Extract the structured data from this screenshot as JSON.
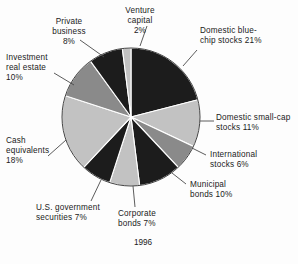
{
  "figure": {
    "year_caption": "1996",
    "background_color": "#fdfdfd",
    "text_color": "#1b1b1b",
    "leader_line_color": "#4a4a4a"
  },
  "chart_data": {
    "type": "pie",
    "title": "",
    "subtitle": "",
    "xlabel": "",
    "ylabel": "",
    "caption": "1996",
    "legend_position": "none",
    "labels_position": "outside-with-leader-lines",
    "grid": false,
    "start_angle_deg": 0,
    "direction": "clockwise",
    "total_percent": 100,
    "categories": [
      "Domestic blue-chip stocks",
      "Domestic small-cap stocks",
      "International stocks",
      "Municipal bonds",
      "Corporate bonds",
      "U.S. government securities",
      "Cash equivalents",
      "Investment real estate",
      "Private business",
      "Venture capital"
    ],
    "values": [
      21,
      11,
      6,
      10,
      7,
      7,
      18,
      10,
      8,
      2
    ],
    "value_unit": "%",
    "colors": [
      "#1c1c1c",
      "#c2c2c2",
      "#8a8a8a",
      "#1c1c1c",
      "#c2c2c2",
      "#1c1c1c",
      "#c2c2c2",
      "#8a8a8a",
      "#1c1c1c",
      "#c2c2c2"
    ],
    "slices": [
      {
        "label": "Domestic blue-chip stocks",
        "value": 21,
        "display": "Domestic blue-\nchip stocks  21%",
        "color": "#1c1c1c"
      },
      {
        "label": "Domestic small-cap stocks",
        "value": 11,
        "display": "Domestic small-cap\nstocks 11%",
        "color": "#c2c2c2"
      },
      {
        "label": "International stocks",
        "value": 6,
        "display": "International\nstocks 6%",
        "color": "#8a8a8a"
      },
      {
        "label": "Municipal bonds",
        "value": 10,
        "display": "Municipal\nbonds 10%",
        "color": "#1c1c1c"
      },
      {
        "label": "Corporate bonds",
        "value": 7,
        "display": "Corporate\nbonds 7%",
        "color": "#c2c2c2"
      },
      {
        "label": "U.S. government securities",
        "value": 7,
        "display": "U.S. government\nsecurities 7%",
        "color": "#1c1c1c"
      },
      {
        "label": "Cash equivalents",
        "value": 18,
        "display": "Cash\nequivalents\n18%",
        "color": "#c2c2c2"
      },
      {
        "label": "Investment real estate",
        "value": 10,
        "display": "Investment\nreal estate\n10%",
        "color": "#8a8a8a"
      },
      {
        "label": "Private business",
        "value": 8,
        "display": "Private\nbusiness\n8%",
        "color": "#1c1c1c"
      },
      {
        "label": "Venture capital",
        "value": 2,
        "display": "Venture\ncapital\n2%",
        "color": "#c2c2c2"
      }
    ]
  }
}
